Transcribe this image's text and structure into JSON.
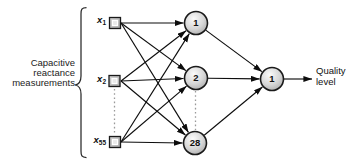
{
  "diagram": {
    "title_semantics": "neural-network-architecture",
    "left_label": {
      "lines": [
        "Capacitive",
        "reactance",
        "measurements"
      ]
    },
    "input_nodes": [
      {
        "base": "x",
        "sub": "1"
      },
      {
        "base": "x",
        "sub": "2"
      },
      {
        "base": "x",
        "sub": "55"
      }
    ],
    "hidden_nodes": [
      {
        "label": "1"
      },
      {
        "label": "2"
      },
      {
        "label": "28"
      }
    ],
    "output_node": {
      "label": "1"
    },
    "output_label": {
      "lines": [
        "Quality",
        "level"
      ]
    },
    "colors": {
      "background": "#ffffff",
      "node_fill_light": "#fbfbfb",
      "node_fill_mid": "#d6d6d6",
      "node_fill_dark": "#a6a6a6",
      "node_border": "#1a1a1a",
      "square_fill": "#bdbdbd",
      "square_inner": "#e9e9e9",
      "edge": "#0d0d0d",
      "dotted_line": "#9a9a9a",
      "text": "#1a1a1a"
    }
  }
}
